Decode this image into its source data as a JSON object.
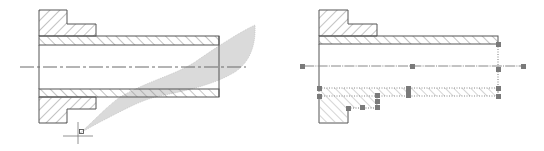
{
  "figure": {
    "left_panel": {
      "label": "",
      "description": "Sleeve cross-section with gray sweep/selection region and cursor"
    },
    "right_panel": {
      "label": "",
      "description": "Sleeve cross-section with selected edges shown dotted with grip handles"
    },
    "colors": {
      "outline": "#555555",
      "hatch": "#8a8a8a",
      "shade": "#d9d9d9",
      "grip": "#7a7a7a",
      "centerline": "#6a6a6a"
    }
  }
}
